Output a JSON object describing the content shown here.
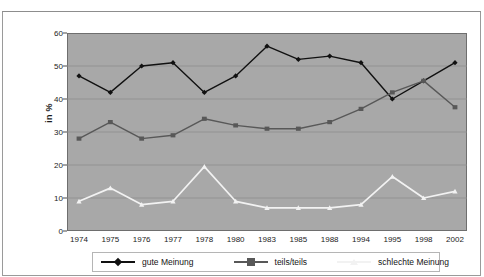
{
  "chart_data": {
    "type": "line",
    "title": "",
    "xlabel": "",
    "ylabel": "in %",
    "ylim": [
      0,
      60
    ],
    "yticks": [
      0,
      10,
      20,
      30,
      40,
      50,
      60
    ],
    "grid": true,
    "legend_position": "bottom",
    "plot_background": "#a8a8a8",
    "categories": [
      "1974",
      "1975",
      "1976",
      "1977",
      "1978",
      "1980",
      "1983",
      "1985",
      "1988",
      "1994",
      "1995",
      "1998",
      "2002"
    ],
    "series": [
      {
        "name": "gute Meinung",
        "color": "#111111",
        "marker": "diamond",
        "values": [
          47,
          42,
          50,
          51,
          42,
          47,
          56,
          52,
          53,
          51,
          40,
          45.5,
          51
        ]
      },
      {
        "name": "teils/teils",
        "color": "#585858",
        "marker": "square",
        "values": [
          28,
          33,
          28,
          29,
          34,
          32,
          31,
          31,
          33,
          37,
          42,
          45.5,
          37.5
        ]
      },
      {
        "name": "schlechte Meinung",
        "color": "#f2f2f2",
        "marker": "triangle",
        "values": [
          9,
          13,
          8,
          9,
          19.5,
          9,
          7,
          7,
          7,
          8,
          16.5,
          10,
          12
        ]
      }
    ]
  }
}
